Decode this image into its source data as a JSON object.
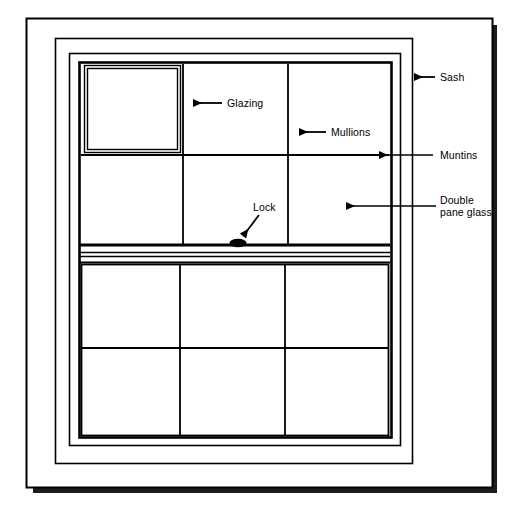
{
  "diagram": {
    "type": "technical-line-drawing",
    "background_color": "#ffffff",
    "line_color": "#000000",
    "shadow_color": "#1a1a1a"
  },
  "labels": {
    "sash": "Sash",
    "glazing": "Glazing",
    "mullions": "Mullions",
    "muntins": "Muntins",
    "double_pane_glass_line1": "Double",
    "double_pane_glass_line2": "pane glass",
    "lock": "Lock"
  },
  "parts": [
    {
      "key": "sash",
      "label": "Sash",
      "callout": "arrow-left"
    },
    {
      "key": "glazing",
      "label": "Glazing",
      "callout": "arrow-left"
    },
    {
      "key": "mullions",
      "label": "Mullions",
      "callout": "arrow-left"
    },
    {
      "key": "muntins",
      "label": "Muntins",
      "callout": "leader-line-arrow-left"
    },
    {
      "key": "double-pane-glass",
      "label": "Double pane glass",
      "callout": "leader-line-arrow-left"
    },
    {
      "key": "lock",
      "label": "Lock",
      "callout": "arrow-diagonal-down-left"
    }
  ],
  "geometry": {
    "outer_frame": {
      "x": 26,
      "y": 18,
      "w": 466,
      "h": 469
    },
    "frame_ring_1": {
      "x": 55,
      "y": 38,
      "w": 357,
      "h": 425
    },
    "frame_ring_2": {
      "x": 69,
      "y": 53,
      "w": 331,
      "h": 392
    },
    "sash_box": {
      "x": 79,
      "y": 62,
      "w": 312,
      "h": 375
    },
    "upper_sash": {
      "x": 81,
      "y": 64,
      "w": 308,
      "h": 181
    },
    "lower_sash": {
      "x": 81,
      "y": 264,
      "w": 308,
      "h": 171
    },
    "glazing_detail_pane": {
      "x": 85,
      "y": 66,
      "w": 95,
      "h": 86
    },
    "mullion_x": [
      183,
      288
    ],
    "upper_muntin_y": 155,
    "lower_muntin_y": 348,
    "meeting_rail_y": [
      245,
      255,
      262
    ],
    "lock_ellipse": {
      "cx": 238,
      "cy": 244,
      "rx": 8,
      "ry": 4
    }
  }
}
